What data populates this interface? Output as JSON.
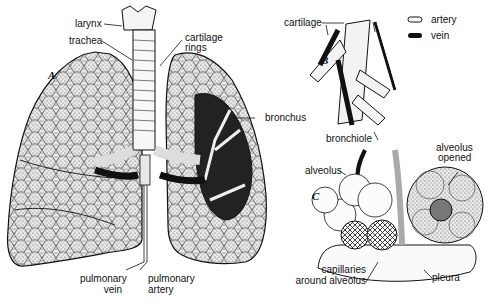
{
  "diagram": {
    "panels": {
      "a": "A",
      "b": "B",
      "c": "C"
    },
    "labels": {
      "larynx": "larynx",
      "trachea": "trachea",
      "cartilage_rings_1": "cartilage",
      "cartilage_rings_2": "rings",
      "bronchus": "bronchus",
      "pulmonary_vein_1": "pulmonary",
      "pulmonary_vein_2": "vein",
      "pulmonary_artery_1": "pulmonary",
      "pulmonary_artery_2": "artery",
      "cartilage": "cartilage",
      "bronchiole": "bronchiole",
      "alveolus": "alveolus",
      "alveolus_opened_1": "alveolus",
      "alveolus_opened_2": "opened",
      "capillaries_1": "capillaries",
      "capillaries_2": "around alveolus",
      "pleura": "pleura"
    },
    "legend": [
      {
        "label": "artery",
        "style": "outlined-white"
      },
      {
        "label": "vein",
        "style": "solid-black"
      }
    ]
  }
}
